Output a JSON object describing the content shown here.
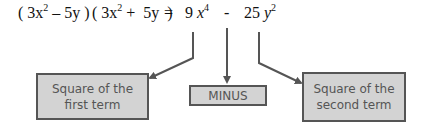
{
  "equation": {
    "lhs": {
      "factor1": {
        "open": "(",
        "coef1": "3x",
        "exp1": "2",
        "op": "–",
        "term2": "5y",
        "close": ")"
      },
      "factor2": {
        "open": "(",
        "coef1": "3x",
        "exp1": "2",
        "op": "+",
        "term2": "5y",
        "close": ")"
      }
    },
    "equals": "=",
    "rhs": {
      "term1": {
        "coef": "9",
        "var": "x",
        "exp": "4"
      },
      "op": "-",
      "term2": {
        "coef": "25",
        "var": "y",
        "exp": "2"
      }
    }
  },
  "labels": {
    "first": "Square of the first term",
    "minus": "MINUS",
    "second": "Square of the second term"
  },
  "colors": {
    "box_fill": "#d3d3d3",
    "box_border": "#555555",
    "label_text": "#555555",
    "arrow": "#555555"
  }
}
